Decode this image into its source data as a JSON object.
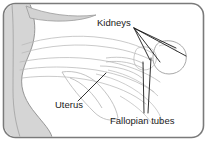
{
  "figure": {
    "type": "anatomical-line-drawing",
    "frame": {
      "shape": "rounded-rectangle",
      "border_color": "#7a7a7a",
      "background_color": "#ffffff",
      "corner_radius_px": 12
    },
    "palette": {
      "outline": "#b4b4b4",
      "shaded_region": "#d5d5d5",
      "shaded_region_stroke": "#8c8c8c",
      "leader_line": "#1a1a1a",
      "label_text": "#1a1a1a"
    },
    "labels": [
      {
        "id": "kidneys",
        "text": "Kidneys",
        "x": 97,
        "y": 26,
        "anchor": "start",
        "leader_count": 4,
        "points_to": "kidney-organs-right"
      },
      {
        "id": "uterus",
        "text": "Uterus",
        "x": 55,
        "y": 108,
        "anchor": "start",
        "leader_count": 1,
        "points_to": "uterus-organ-center"
      },
      {
        "id": "fallopian-tubes",
        "text": "Fallopian tubes",
        "x": 110,
        "y": 124,
        "anchor": "start",
        "leader_count": 2,
        "points_to": "fallopian-tube-structures"
      }
    ],
    "structures": [
      {
        "id": "body-wall-left",
        "name": "body wall",
        "fill": "#d5d5d5"
      },
      {
        "id": "top-crescent",
        "name": "upper abdominal margin",
        "fill": "#d2d2d2"
      },
      {
        "id": "kidney-oval-right",
        "name": "kidney",
        "fill": "none"
      },
      {
        "id": "uterus-body",
        "name": "uterus",
        "fill": "none"
      },
      {
        "id": "tube-lines",
        "name": "fallopian tubes",
        "fill": "none"
      }
    ]
  }
}
